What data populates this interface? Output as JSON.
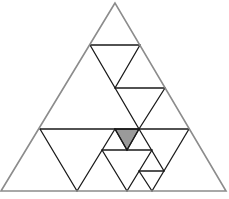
{
  "diagram": {
    "colors": {
      "background": "#ffffff",
      "outer_stroke": "#8c8c8c",
      "inner_stroke": "#1a1a1a",
      "shaded_fill": "#9a9a9a"
    },
    "outer_triangle": {
      "points": "115,3 1,191 226,191"
    },
    "inner_lines": [
      {
        "name": "hline-1",
        "x1": 90,
        "y1": 45,
        "x2": 140,
        "y2": 45
      },
      {
        "name": "diag-long-1",
        "x1": 90,
        "y1": 45,
        "x2": 139,
        "y2": 129
      },
      {
        "name": "diag-2",
        "x1": 140,
        "y1": 45,
        "x2": 115,
        "y2": 88
      },
      {
        "name": "hline-2",
        "x1": 115,
        "y1": 88,
        "x2": 165,
        "y2": 88
      },
      {
        "name": "diag-3",
        "x1": 165,
        "y1": 88,
        "x2": 139,
        "y2": 129
      },
      {
        "name": "hline-3",
        "x1": 40,
        "y1": 129,
        "x2": 189,
        "y2": 129
      },
      {
        "name": "diag-4",
        "x1": 40,
        "y1": 129,
        "x2": 77,
        "y2": 191
      },
      {
        "name": "diag-5",
        "x1": 115,
        "y1": 129,
        "x2": 77,
        "y2": 191
      },
      {
        "name": "diag-6",
        "x1": 115,
        "y1": 129,
        "x2": 127,
        "y2": 150
      },
      {
        "name": "diag-7",
        "x1": 139,
        "y1": 129,
        "x2": 164,
        "y2": 171
      },
      {
        "name": "diag-8",
        "x1": 189,
        "y1": 129,
        "x2": 152,
        "y2": 191
      },
      {
        "name": "hline-4",
        "x1": 102,
        "y1": 150,
        "x2": 152,
        "y2": 150
      },
      {
        "name": "diag-9",
        "x1": 102,
        "y1": 150,
        "x2": 127,
        "y2": 191
      },
      {
        "name": "diag-10",
        "x1": 152,
        "y1": 150,
        "x2": 127,
        "y2": 191
      },
      {
        "name": "diag-11",
        "x1": 139,
        "y1": 129,
        "x2": 127,
        "y2": 150
      },
      {
        "name": "hline-5",
        "x1": 139,
        "y1": 171,
        "x2": 164,
        "y2": 171
      },
      {
        "name": "diag-12",
        "x1": 139,
        "y1": 171,
        "x2": 152,
        "y2": 191
      }
    ],
    "shaded_triangle": {
      "points": "115,129 139,129 127,150"
    }
  }
}
